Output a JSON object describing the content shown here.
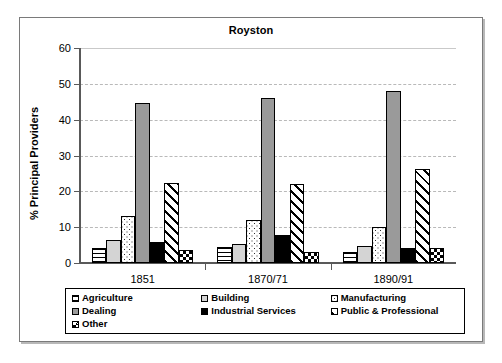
{
  "figure": {
    "title": "Royston"
  },
  "axes": {
    "ylabel": "% Principal Providers",
    "xlabel": "",
    "yticks": [
      "0",
      "10",
      "20",
      "30",
      "40",
      "50",
      "60"
    ]
  },
  "legend": {
    "items": [
      {
        "label": "Agriculture",
        "pattern": "horizontal-lines"
      },
      {
        "label": "Building",
        "pattern": "light-grey"
      },
      {
        "label": "Manufacturing",
        "pattern": "dots"
      },
      {
        "label": "Dealing",
        "pattern": "medium-grey"
      },
      {
        "label": "Industrial Services",
        "pattern": "solid-black"
      },
      {
        "label": "Public & Professional",
        "pattern": "diagonal-hatch"
      },
      {
        "label": "Other",
        "pattern": "checkerboard"
      }
    ]
  },
  "chart_data": {
    "type": "bar",
    "title": "Royston",
    "xlabel": "",
    "ylabel": "% Principal Providers",
    "ylim": [
      0,
      60
    ],
    "ytick_step": 10,
    "grid": true,
    "legend_position": "bottom",
    "categories": [
      "1851",
      "1870/71",
      "1890/91"
    ],
    "series": [
      {
        "name": "Agriculture",
        "values": [
          4.3,
          4.4,
          3.0
        ]
      },
      {
        "name": "Building",
        "values": [
          6.4,
          5.2,
          4.7
        ]
      },
      {
        "name": "Manufacturing",
        "values": [
          13.0,
          12.0,
          10.1
        ]
      },
      {
        "name": "Dealing",
        "values": [
          44.7,
          46.0,
          47.9
        ]
      },
      {
        "name": "Industrial Services",
        "values": [
          6.0,
          7.9,
          4.2
        ]
      },
      {
        "name": "Public & Professional",
        "values": [
          22.2,
          22.1,
          26.3
        ]
      },
      {
        "name": "Other",
        "values": [
          3.6,
          3.2,
          4.3
        ]
      }
    ]
  }
}
